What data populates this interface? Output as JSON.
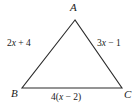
{
  "figure": {
    "kind": "triangle-diagram",
    "background_color": "#ffffff",
    "stroke_color": "#2b2b2b",
    "text_color": "#1a1a1a",
    "vertices": {
      "a": {
        "label": "A",
        "x": 75,
        "y": 20
      },
      "b": {
        "label": "B",
        "x": 22,
        "y": 88
      },
      "c": {
        "label": "C",
        "x": 122,
        "y": 88
      }
    },
    "sides": {
      "ab": {
        "label": "2x + 4",
        "coefficient": "2",
        "variable": "x",
        "operator": "+",
        "constant": "4"
      },
      "ac": {
        "label": "3x − 1",
        "coefficient": "3",
        "variable": "x",
        "operator": "−",
        "constant": "1"
      },
      "bc": {
        "label": "4(x − 2)",
        "coefficient": "4",
        "variable": "x",
        "operator": "−",
        "constant": "2"
      }
    }
  }
}
